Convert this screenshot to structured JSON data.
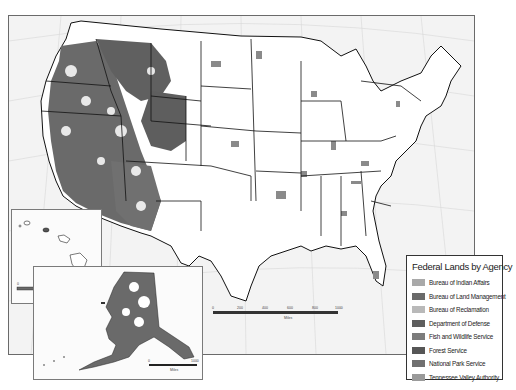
{
  "map": {
    "title": "Federal Lands by Agency",
    "background_color": "#f3f3f3",
    "land_color": "#ffffff",
    "border_color": "#111111"
  },
  "legend": {
    "title": "Federal Lands by Agency",
    "items": [
      {
        "label": "Bureau of Indian Affairs",
        "color": "#a9a9a9"
      },
      {
        "label": "Bureau of Land Management",
        "color": "#6a6a6a"
      },
      {
        "label": "Bureau of Reclamation",
        "color": "#b9b9b9"
      },
      {
        "label": "Department of Defense",
        "color": "#5e5e5e"
      },
      {
        "label": "Fish and Wildlife Service",
        "color": "#7c7c7c"
      },
      {
        "label": "Forest Service",
        "color": "#565656"
      },
      {
        "label": "National Park Service",
        "color": "#707070"
      },
      {
        "label": "Tennessee Valley Authority",
        "color": "#9a9a9a"
      }
    ]
  },
  "main_scale": {
    "ticks": [
      "0",
      "200",
      "400",
      "600",
      "800",
      "1000"
    ],
    "unit": "Miles"
  },
  "hawaii_scale": {
    "ticks": [
      "0",
      "100",
      "200"
    ],
    "unit": "Miles"
  },
  "alaska_scale": {
    "ticks": [
      "0",
      "200",
      "400",
      "600",
      "800",
      "1000"
    ],
    "unit": "Miles"
  },
  "insets": {
    "hawaii": "Hawaii",
    "alaska": "Alaska"
  }
}
